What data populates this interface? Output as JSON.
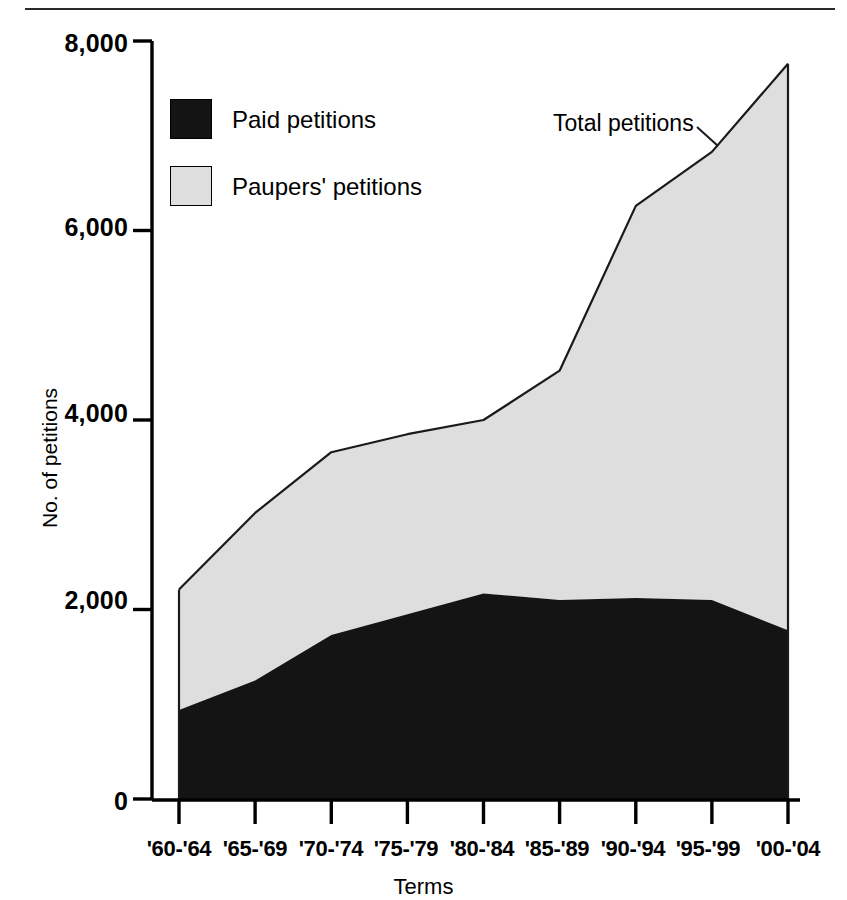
{
  "chart_data": {
    "type": "area",
    "stacked": true,
    "title": "",
    "xlabel": "Terms",
    "ylabel": "No. of petitions",
    "categories": [
      "'60-'64",
      "'65-'69",
      "'70-'74",
      "'75-'79",
      "'80-'84",
      "'85-'89",
      "'90-'94",
      "'95-'99",
      "'00-'04"
    ],
    "series": [
      {
        "name": "Paid petitions",
        "color": "#141414",
        "values": [
          940,
          1250,
          1730,
          1950,
          2170,
          2100,
          2120,
          2100,
          1780
        ]
      },
      {
        "name": "Paupers' petitions",
        "color": "#dedede",
        "values": [
          1270,
          1770,
          1930,
          1900,
          1830,
          2420,
          4140,
          4730,
          5980
        ]
      }
    ],
    "total_series": {
      "name": "Total petitions",
      "values": [
        2210,
        3020,
        3660,
        3850,
        4000,
        4520,
        6260,
        6830,
        7760
      ]
    },
    "ylim": [
      0,
      8000
    ],
    "ytick_values": [
      0,
      2000,
      4000,
      6000,
      8000
    ],
    "ytick_labels": [
      "0",
      "2,000",
      "4,000",
      "6,000",
      "8,000"
    ],
    "grid": false,
    "legend_position": "upper-left-inside",
    "annotations": [
      {
        "text": "Total petitions",
        "target_category": "'95-'99"
      }
    ]
  },
  "legend": {
    "items": [
      {
        "label": "Paid petitions",
        "swatch": "paid-swatch",
        "color": "#141414"
      },
      {
        "label": "Paupers' petitions",
        "swatch": "paupers-swatch",
        "color": "#dedede"
      }
    ]
  },
  "axes": {
    "y_title": "No. of petitions",
    "x_title": "Terms",
    "y_labels": [
      "8,000",
      "6,000",
      "4,000",
      "2,000",
      "0"
    ],
    "x_labels": [
      "'60-'64",
      "'65-'69",
      "'70-'74",
      "'75-'79",
      "'80-'84",
      "'85-'89",
      "'90-'94",
      "'95-'99",
      "'00-'04"
    ]
  },
  "annotation": {
    "total_label": "Total petitions"
  },
  "colors": {
    "paid_fill": "#141414",
    "paupers_fill": "#dedede",
    "outline": "#1a1a1a",
    "axis": "#000000",
    "background": "#ffffff"
  }
}
